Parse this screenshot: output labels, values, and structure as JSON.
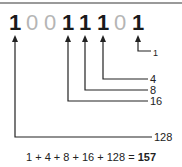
{
  "diagram": {
    "binary_digits": [
      "1",
      "0",
      "0",
      "1",
      "1",
      "1",
      "0",
      "1"
    ],
    "place_value_labels": {
      "bit_0": "1",
      "bit_2": "4",
      "bit_3": "8",
      "bit_4": "16",
      "bit_7": "128"
    },
    "equation": {
      "terms": "1 + 4 + 8 + 16 + 128 =",
      "result": "157"
    },
    "colors": {
      "one_digit": "#1a1a1a",
      "zero_digit": "#b5b5b5",
      "line": "#222222",
      "rule": "#9a9a9a"
    }
  }
}
